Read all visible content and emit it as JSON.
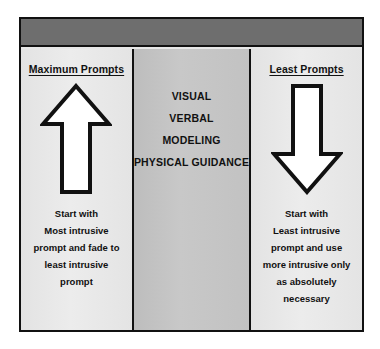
{
  "diagram": {
    "title_band": "",
    "colors": {
      "frame_border": "#111111",
      "header_band": "#6e6e6e",
      "side_column": "#e8e8e8",
      "center_column": "#c4c4c4",
      "arrow_fill": "#ffffff",
      "arrow_stroke": "#111111",
      "text": "#111111"
    },
    "left_column": {
      "heading": "Maximum Prompts",
      "arrow_icon": "arrow-up-icon",
      "arrow_direction": "up",
      "caption_lines": [
        "Start with",
        "Most intrusive",
        "prompt and fade to",
        "least intrusive",
        "prompt"
      ]
    },
    "center_column": {
      "prompt_types": [
        "VISUAL",
        "VERBAL",
        "MODELING",
        "PHYSICAL GUIDANCE"
      ]
    },
    "right_column": {
      "heading": "Least Prompts",
      "arrow_icon": "arrow-down-icon",
      "arrow_direction": "down",
      "caption_lines": [
        "Start with",
        "Least intrusive",
        "prompt and use",
        "more intrusive only",
        "as absolutely",
        "necessary"
      ]
    }
  }
}
